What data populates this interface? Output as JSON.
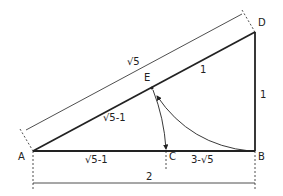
{
  "diagram": {
    "points": {
      "A": "A",
      "B": "B",
      "C": "C",
      "D": "D",
      "E": "E"
    },
    "labels": {
      "hypotenuse": "√5",
      "ED": "1",
      "AE": "√5-1",
      "BD": "1",
      "AC": "√5-1",
      "CB": "3-√5",
      "AB_total": "2"
    }
  }
}
